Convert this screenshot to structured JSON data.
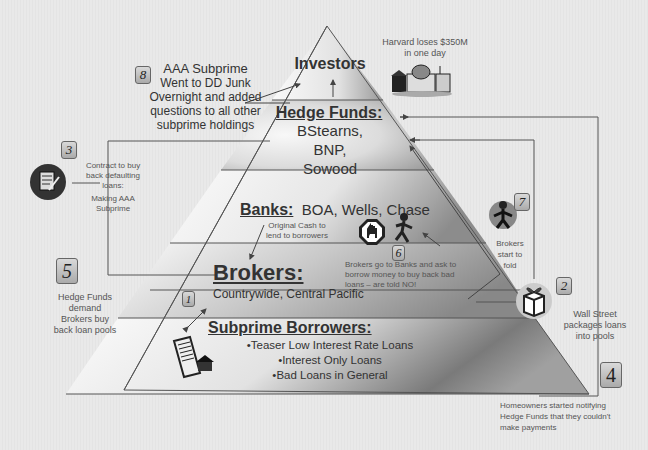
{
  "pyramid": {
    "tiers": [
      {
        "id": "investors",
        "title": "Investors",
        "details": []
      },
      {
        "id": "hedge-funds",
        "title": "Hedge Funds:",
        "details": [
          "BStearns,",
          "BNP,",
          "Sowood"
        ]
      },
      {
        "id": "banks",
        "title": "Banks:",
        "inline": "BOA, Wells, Chase"
      },
      {
        "id": "brokers",
        "title": "Brokers:",
        "details": [
          "Countrywide, Central Pacific"
        ]
      },
      {
        "id": "subprime-borrowers",
        "title": "Subprime Borrowers:",
        "details": [
          "•Teaser Low Interest Rate Loans",
          "•Interest Only Loans",
          "•Bad Loans in General"
        ]
      }
    ]
  },
  "annotations": {
    "harvard": {
      "line1": "Harvard loses $350M",
      "line2": "in one day"
    },
    "original_cash": {
      "line1": "Original Cash to",
      "line2": "lend to borrowers"
    }
  },
  "steps": [
    {
      "num": "1",
      "text": []
    },
    {
      "num": "2",
      "text": [
        "Wall Street",
        "packages loans",
        "into pools"
      ]
    },
    {
      "num": "3",
      "text": [
        "Contract to buy",
        "back defaulting",
        "loans:",
        "Making AAA",
        "Subprime"
      ]
    },
    {
      "num": "4",
      "text": [
        "Homeowners started notifying",
        "Hedge Funds that they couldn't",
        "make payments"
      ]
    },
    {
      "num": "5",
      "text": [
        "Hedge Funds",
        "demand",
        "Brokers buy",
        "back loan pools"
      ]
    },
    {
      "num": "6",
      "text": [
        "Brokers go to Banks and ask to",
        "borrow money to buy back bad",
        "loans – are told NO!"
      ]
    },
    {
      "num": "7",
      "text": [
        "Brokers",
        "start to",
        "fold"
      ]
    },
    {
      "num": "8",
      "text": [
        "AAA Subprime",
        "Went to DD Junk",
        "Overnight and added",
        "questions to all other",
        "subprime holdings"
      ]
    }
  ],
  "icons": [
    "university-buildings-icon",
    "contract-document-icon",
    "stop-sign-icon",
    "running-man-icon",
    "stressed-broker-icon",
    "gift-box-icon",
    "loan-papers-house-icon"
  ],
  "colors": {
    "line": "#555555",
    "tier_shade": "#9a9a9a",
    "background": "#e8e8e8"
  }
}
